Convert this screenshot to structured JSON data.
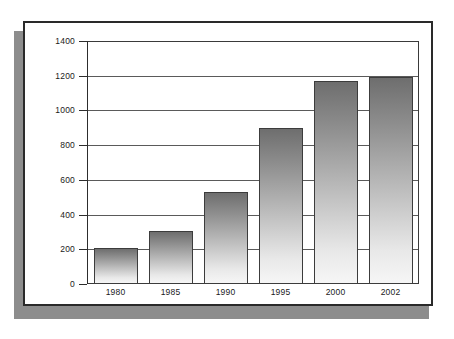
{
  "chart_data": {
    "type": "bar",
    "title": "",
    "subtitle": "",
    "xlabel": "",
    "ylabel": "",
    "categories": [
      "1980",
      "1985",
      "1990",
      "1995",
      "2000",
      "2002"
    ],
    "values": [
      210,
      305,
      530,
      900,
      1175,
      1200
    ],
    "ylim": [
      0,
      1400
    ],
    "ytick_labels": [
      "0",
      "200",
      "400",
      "600",
      "800",
      "1000",
      "1200",
      "1400"
    ],
    "ytick_values": [
      0,
      200,
      400,
      600,
      800,
      1000,
      1200,
      1400
    ],
    "grid": true,
    "legend": null,
    "legend_position": "none",
    "annotations": [],
    "series": [
      {
        "name": "",
        "values": [
          210,
          305,
          530,
          900,
          1175,
          1200
        ]
      }
    ]
  },
  "style": {
    "bar_fill_top": "#6e6e6e",
    "bar_fill_bottom": "#f6f6f6",
    "bar_border": "#3c3c3c",
    "gridline_color": "#5a5a5a",
    "axis_color": "#2d2d2d",
    "card_border": "#2a2a2a",
    "card_background": "#ffffff",
    "shadow_color": "#8d8d8d",
    "page_background": "#ffffff",
    "tick_text_color": "#1a1a1a"
  }
}
